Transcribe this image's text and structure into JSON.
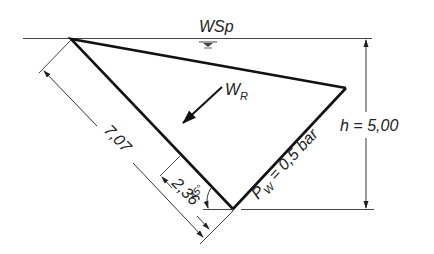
{
  "diagram": {
    "water_surface_label": "WSp",
    "resultant_force_label": "W",
    "resultant_force_subscript": "R",
    "height_label": "h = 5,00",
    "pressure_label_prefix": "P",
    "pressure_label_subscript": "W",
    "pressure_label_suffix": " = 0,5 bar",
    "slant_length_label": "7,07",
    "force_position_label": "2,36",
    "angle_label": "45°",
    "colors": {
      "stroke": "#111111",
      "thin_stroke": "#333333",
      "text": "#222222",
      "background": "#ffffff"
    }
  }
}
